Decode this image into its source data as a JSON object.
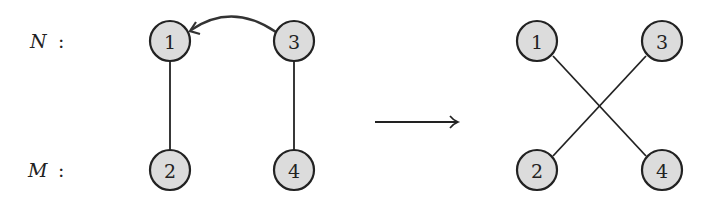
{
  "diagram": {
    "row_labels": {
      "top": "N",
      "bottom": "M",
      "separator": ":"
    },
    "left_graph": {
      "nodes": [
        {
          "id": "1",
          "label": "1",
          "x": 170,
          "y": 41
        },
        {
          "id": "3",
          "label": "3",
          "x": 294,
          "y": 41
        },
        {
          "id": "2",
          "label": "2",
          "x": 170,
          "y": 170
        },
        {
          "id": "4",
          "label": "4",
          "x": 294,
          "y": 170
        }
      ],
      "edges": [
        [
          "1",
          "2"
        ],
        [
          "3",
          "4"
        ]
      ],
      "curved_arrow": {
        "from": "3",
        "to": "1"
      }
    },
    "transition_arrow": "→",
    "right_graph": {
      "nodes": [
        {
          "id": "1",
          "label": "1",
          "x": 537,
          "y": 41
        },
        {
          "id": "3",
          "label": "3",
          "x": 662,
          "y": 41
        },
        {
          "id": "2",
          "label": "2",
          "x": 537,
          "y": 170
        },
        {
          "id": "4",
          "label": "4",
          "x": 662,
          "y": 170
        }
      ],
      "edges": [
        [
          "1",
          "4"
        ],
        [
          "3",
          "2"
        ]
      ]
    },
    "colors": {
      "node_fill": "#dcdcdc",
      "stroke": "#222222"
    }
  }
}
